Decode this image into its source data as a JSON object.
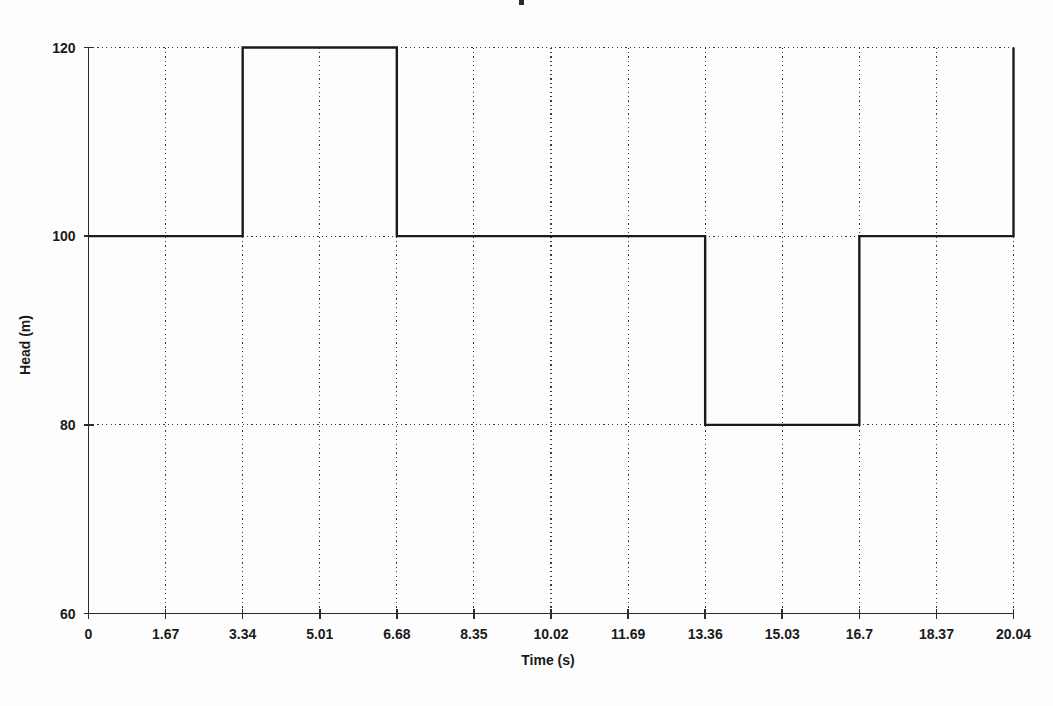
{
  "chart_data": {
    "type": "line",
    "title": "",
    "xlabel": "Time (s)",
    "ylabel": "Head (m)",
    "xlim": [
      0,
      20.04
    ],
    "ylim": [
      60,
      120
    ],
    "grid": true,
    "legend": null,
    "x_tick_labels": [
      "0",
      "1.67",
      "3.34",
      "5.01",
      "6.68",
      "8.35",
      "10.02",
      "11.69",
      "13.36",
      "15.03",
      "16.7",
      "18.37",
      "20.04"
    ],
    "x_ticks": [
      0,
      1.67,
      3.34,
      5.01,
      6.68,
      8.35,
      10.02,
      11.69,
      13.36,
      15.03,
      16.7,
      18.37,
      20.04
    ],
    "y_tick_labels": [
      "60",
      "80",
      "100",
      "120"
    ],
    "y_ticks": [
      60,
      80,
      100,
      120
    ],
    "series": [
      {
        "name": "Head",
        "step": "post",
        "x": [
          0,
          3.34,
          3.34,
          6.68,
          6.68,
          13.36,
          13.36,
          16.7,
          16.7,
          20.04,
          20.04
        ],
        "y": [
          100,
          100,
          120,
          120,
          100,
          100,
          80,
          80,
          100,
          100,
          120
        ]
      }
    ],
    "segments": [
      {
        "t_start": 0,
        "t_end": 3.34,
        "value": 100
      },
      {
        "t_start": 3.34,
        "t_end": 6.68,
        "value": 120
      },
      {
        "t_start": 6.68,
        "t_end": 13.36,
        "value": 100
      },
      {
        "t_start": 13.36,
        "t_end": 16.7,
        "value": 80
      },
      {
        "t_start": 16.7,
        "t_end": 20.04,
        "value": 100
      },
      {
        "t_start": 20.04,
        "t_end": 20.04,
        "value": 120
      }
    ],
    "line_color": "#1b1b1b",
    "grid_color": "#3a3a3a",
    "axis_color": "#2b2b2b",
    "background_color": "#fdfdfd"
  }
}
